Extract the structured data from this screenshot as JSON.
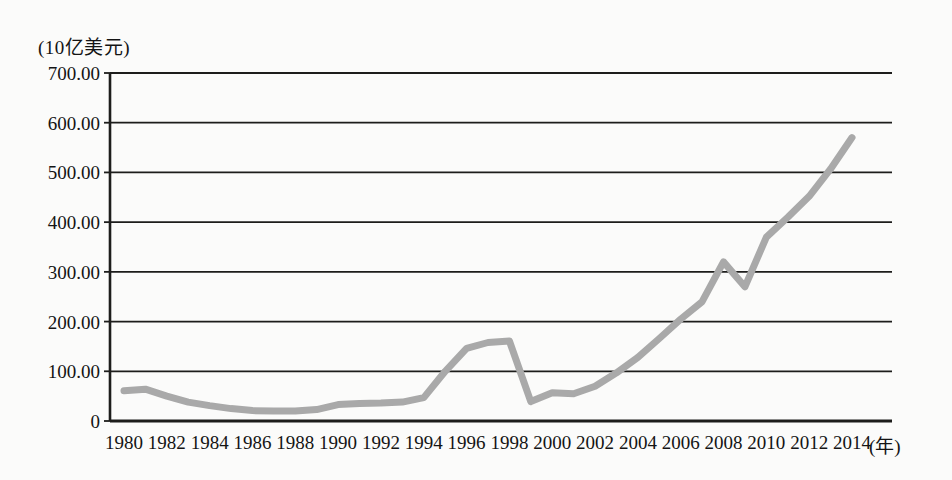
{
  "page": {
    "background": "#fbfbfa"
  },
  "chart": {
    "unit_label": "(10亿美元)",
    "year_suffix_label": "(年)"
  },
  "chart_data": {
    "type": "line",
    "title": "",
    "ylabel": "(10亿美元)",
    "xlabel": "(年)",
    "ylim": [
      0,
      700
    ],
    "grid": true,
    "legend": "none",
    "line_color": "#a9a9a9",
    "line_width": 7,
    "axis_color": "#1d1d1b",
    "ytick_values": [
      0,
      100,
      200,
      300,
      400,
      500,
      600,
      700
    ],
    "ytick_labels": [
      "0",
      "100.00",
      "200.00",
      "300.00",
      "400.00",
      "500.00",
      "600.00",
      "700.00"
    ],
    "xtick_labels": [
      "1980",
      "1982",
      "1984",
      "1986",
      "1988",
      "1990",
      "1992",
      "1994",
      "1996",
      "1998",
      "2000",
      "2002",
      "2004",
      "2006",
      "2008",
      "2010",
      "2012",
      "2014"
    ],
    "x": [
      1980,
      1981,
      1982,
      1983,
      1984,
      1985,
      1986,
      1987,
      1988,
      1989,
      1990,
      1991,
      1992,
      1993,
      1994,
      1995,
      1996,
      1997,
      1998,
      1999,
      2000,
      2001,
      2002,
      2003,
      2004,
      2005,
      2006,
      2007,
      2008,
      2009,
      2010,
      2011,
      2012,
      2013,
      2014
    ],
    "values": [
      61,
      64,
      50,
      38,
      31,
      25,
      21,
      20,
      20,
      23,
      33,
      35,
      36,
      38,
      47,
      100,
      146,
      158,
      161,
      39,
      57,
      55,
      70,
      97,
      128,
      166,
      205,
      240,
      320,
      270,
      370,
      410,
      452,
      507,
      570
    ]
  }
}
